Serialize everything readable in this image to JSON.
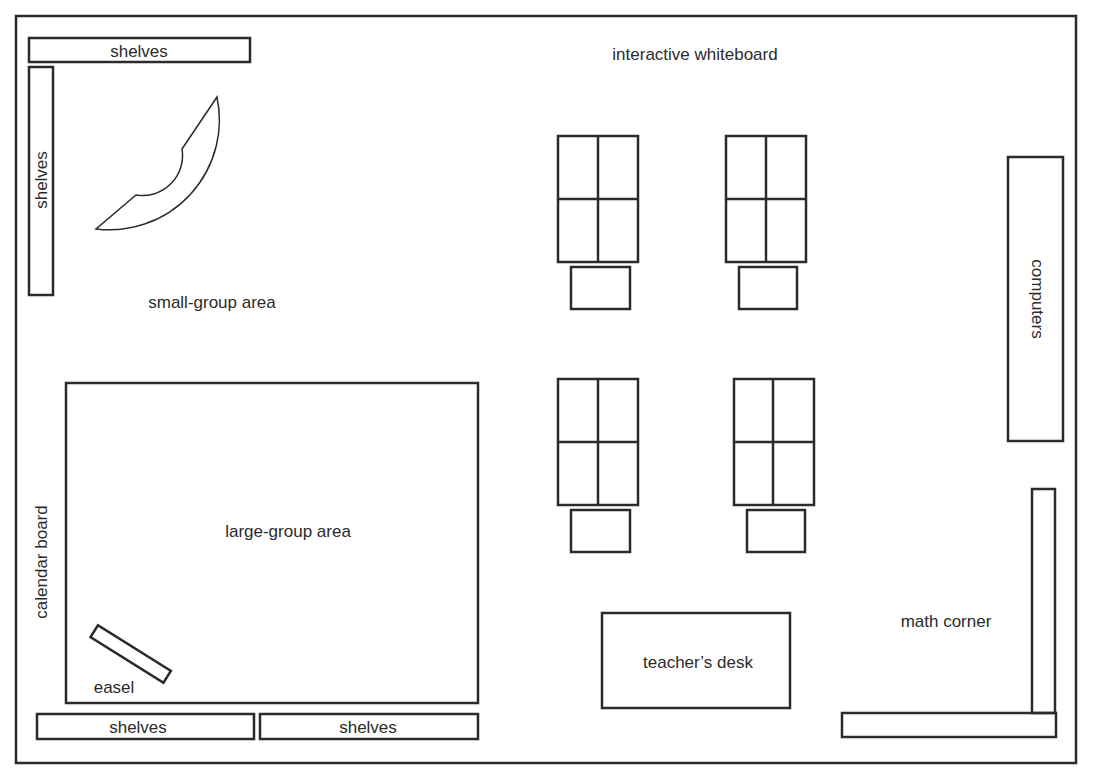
{
  "diagram": {
    "stroke_color": "#2b2b2b",
    "background": "#ffffff",
    "labels": {
      "shelves_top": "shelves",
      "shelves_left": "shelves",
      "small_group_area": "small-group area",
      "interactive_whiteboard": "interactive whiteboard",
      "computers": "computers",
      "large_group_area": "large-group area",
      "calendar_board": "calendar board",
      "easel": "easel",
      "shelves_bottom_left": "shelves",
      "shelves_bottom_right": "shelves",
      "teachers_desk": "teacher’s desk",
      "math_corner": "math corner"
    },
    "desk_clusters": [
      {
        "name": "desk-cluster-1",
        "seats": 4
      },
      {
        "name": "desk-cluster-2",
        "seats": 4
      },
      {
        "name": "desk-cluster-3",
        "seats": 4
      },
      {
        "name": "desk-cluster-4",
        "seats": 4
      }
    ]
  }
}
